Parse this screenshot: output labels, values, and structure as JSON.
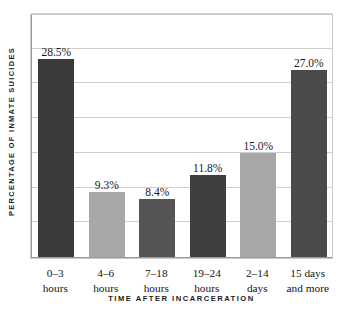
{
  "chart_data": {
    "type": "bar",
    "title": "",
    "xlabel": "TIME AFTER INCARCERATION",
    "ylabel": "PERCENTAGE OF INMATE SUICIDES",
    "categories": [
      "0–3 hours",
      "4–6 hours",
      "7–18 hours",
      "19–24 hours",
      "2–14 days",
      "15 days and more"
    ],
    "category_lines": [
      {
        "line1": "0–3",
        "line2": "hours"
      },
      {
        "line1": "4–6",
        "line2": "hours"
      },
      {
        "line1": "7–18",
        "line2": "hours"
      },
      {
        "line1": "19–24",
        "line2": "hours"
      },
      {
        "line1": "2–14",
        "line2": "days"
      },
      {
        "line1": "15 days",
        "line2": "and more"
      }
    ],
    "values": [
      28.5,
      9.3,
      8.4,
      11.8,
      15.0,
      27.0
    ],
    "value_labels": [
      "28.5%",
      "9.3%",
      "8.4%",
      "11.8%",
      "15.0%",
      "27.0%"
    ],
    "bar_colors": [
      "#3a3a3a",
      "#a8a8a8",
      "#555555",
      "#3f3f3f",
      "#a8a8a8",
      "#4a4a4a"
    ],
    "ylim": [
      0,
      35
    ],
    "ytick_values": [
      0,
      5,
      10,
      15,
      20,
      25,
      30,
      35
    ],
    "ytick_labels": [],
    "grid": true,
    "grid_axis": "y",
    "legend": false,
    "legend_position": "none",
    "units": "percent",
    "background_color": "#ffffff",
    "frame_color": "#c9c9c9",
    "gridline_color": "#cfcfcf"
  }
}
